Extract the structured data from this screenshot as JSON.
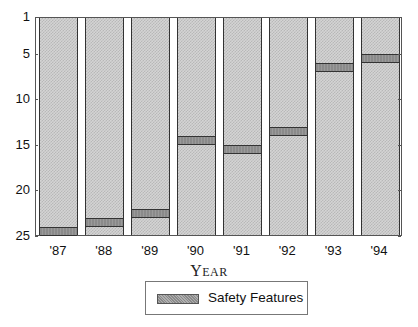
{
  "chart_data": {
    "type": "bar",
    "title": "",
    "xlabel": "Year",
    "ylabel": "",
    "y_axis_inverted": true,
    "ylim": [
      1,
      25
    ],
    "yticks": [
      1,
      5,
      10,
      15,
      20,
      25
    ],
    "categories": [
      "'87",
      "'88",
      "'89",
      "'90",
      "'91",
      "'92",
      "'93",
      "'94"
    ],
    "series": [
      {
        "name": "Safety Features",
        "rank_band": [
          [
            24,
            25
          ],
          [
            23,
            24
          ],
          [
            22,
            23
          ],
          [
            14,
            15
          ],
          [
            15,
            16
          ],
          [
            13,
            14
          ],
          [
            6,
            7
          ],
          [
            5,
            6
          ]
        ],
        "values": [
          24,
          23,
          22,
          14,
          15,
          13,
          6,
          5
        ]
      }
    ],
    "legend": {
      "position": "bottom",
      "entries": [
        "Safety Features"
      ]
    },
    "grid": false
  },
  "axis": {
    "xlabel_first": "Y",
    "xlabel_rest": "EAR",
    "yticks": [
      "1",
      "5",
      "10",
      "15",
      "20",
      "25"
    ],
    "xticks": [
      "'87",
      "'88",
      "'89",
      "'90",
      "'91",
      "'92",
      "'93",
      "'94"
    ]
  },
  "legend": {
    "label": "Safety Features"
  }
}
